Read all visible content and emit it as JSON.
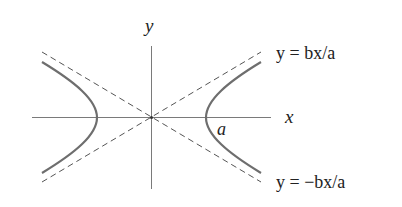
{
  "diagram": {
    "type": "hyperbola",
    "axes": {
      "x_label": "x",
      "y_label": "y"
    },
    "vertex_label": "a",
    "asymptotes": [
      {
        "label": "y = bx/a",
        "style": "dashed"
      },
      {
        "label": "y = −bx/a",
        "style": "dashed"
      }
    ],
    "colors": {
      "axis": "#777777",
      "curve": "#707070",
      "asymptote": "#555555",
      "text": "#222222"
    }
  }
}
